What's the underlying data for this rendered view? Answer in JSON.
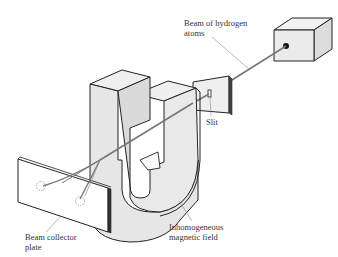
{
  "diagram": {
    "type": "stern-gerlach-apparatus",
    "colors": {
      "outline": "#222222",
      "face_light": "#eeeeee",
      "face_mid": "#dcdcdc",
      "face_dark": "#cccccc",
      "beam": "#777777",
      "leader_line": "#888888",
      "text": "#333333"
    },
    "labels": {
      "beam_source": [
        "Beam of hydrogen",
        "atoms"
      ],
      "slit": [
        "Slit"
      ],
      "magnet": [
        "Inhomogeneous",
        "magnetic field"
      ],
      "collector": [
        "Beam collector",
        "plate"
      ]
    }
  }
}
